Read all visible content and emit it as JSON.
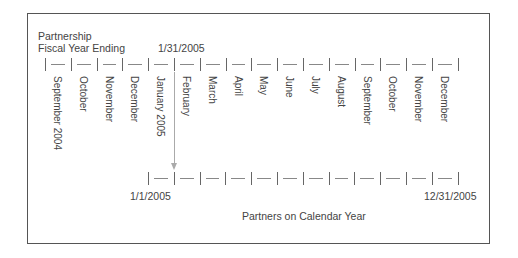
{
  "header": {
    "line1": "Partnership",
    "line2": "Fiscal Year Ending",
    "fiscal_date": "1/31/2005"
  },
  "top_timeline": {
    "months": [
      "September 2004",
      "October",
      "November",
      "December",
      "January 2005",
      "February",
      "March",
      "April",
      "May",
      "June",
      "July",
      "August",
      "September",
      "October",
      "November",
      "December"
    ]
  },
  "bottom_timeline": {
    "start_label": "1/1/2005",
    "end_label": "12/31/2005",
    "caption": "Partners on Calendar Year",
    "intervals": 12
  },
  "colors": {
    "border": "#555555",
    "tick": "#666666",
    "arrow": "#aaaaaa",
    "text": "#444444"
  }
}
